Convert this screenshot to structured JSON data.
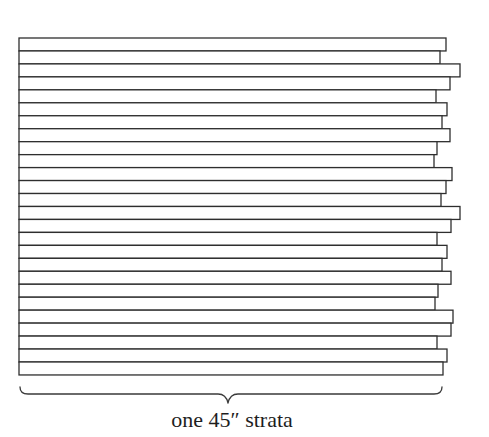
{
  "diagram": {
    "caption": "one 45″ strata",
    "colors": {
      "stroke": "#2e2e2e",
      "fill": "#ffffff",
      "text": "#1e1e1e"
    },
    "stack": {
      "left_x": 19,
      "top_y": 38,
      "bar_height": 12.96,
      "bar_count": 26,
      "right_edges": [
        446,
        440,
        460,
        450,
        436,
        447,
        442,
        450,
        437,
        434,
        452,
        446,
        441,
        460,
        451,
        437,
        447,
        442,
        451,
        438,
        435,
        453,
        451,
        437,
        447,
        443
      ]
    },
    "brace": {
      "left_x": 20,
      "right_x": 442,
      "top_y": 387,
      "line_y": 394,
      "tip_x": 228,
      "tip_y": 403
    },
    "caption_position": {
      "x": 232,
      "y": 427
    }
  }
}
